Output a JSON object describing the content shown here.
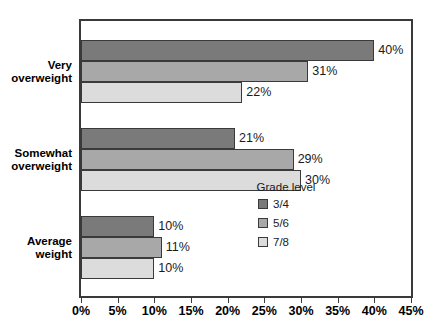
{
  "chart_data": {
    "type": "bar",
    "orientation": "horizontal",
    "title": "",
    "xlabel": "",
    "ylabel": "",
    "xlim": [
      0,
      45
    ],
    "xtick_labels": [
      "0%",
      "5%",
      "10%",
      "15%",
      "20%",
      "25%",
      "30%",
      "35%",
      "40%",
      "45%"
    ],
    "xticks": [
      0,
      5,
      10,
      15,
      20,
      25,
      30,
      35,
      40,
      45
    ],
    "grid": false,
    "legend_title": "Grade level",
    "legend_position": "inside-lower-right",
    "categories": [
      "Very overweight",
      "Somewhat overweight",
      "Average weight"
    ],
    "series": [
      {
        "name": "3/4",
        "color": "#7a7a7a",
        "values": [
          40,
          31,
          10
        ],
        "data_labels": [
          "40%",
          "21%",
          "10%"
        ]
      },
      {
        "name": "5/6",
        "color": "#a8a8a8",
        "values": [
          31,
          29,
          11
        ],
        "data_labels": [
          "31%",
          "29%",
          "11%"
        ]
      },
      {
        "name": "7/8",
        "color": "#dcdcdc",
        "values": [
          22,
          30,
          10
        ],
        "data_labels": [
          "22%",
          "30%",
          "10%"
        ]
      }
    ],
    "groups": [
      {
        "category": "Very overweight",
        "category_line1": "Very",
        "category_line2": "overweight",
        "bars": [
          {
            "series": "3/4",
            "value": 40,
            "label": "40%",
            "color": "#7a7a7a"
          },
          {
            "series": "5/6",
            "value": 31,
            "label": "31%",
            "color": "#a8a8a8"
          },
          {
            "series": "7/8",
            "value": 22,
            "label": "22%",
            "color": "#dcdcdc"
          }
        ]
      },
      {
        "category": "Somewhat overweight",
        "category_line1": "Somewhat",
        "category_line2": "overweight",
        "bars": [
          {
            "series": "3/4",
            "value": 21,
            "label": "21%",
            "color": "#7a7a7a"
          },
          {
            "series": "5/6",
            "value": 29,
            "label": "29%",
            "color": "#a8a8a8"
          },
          {
            "series": "7/8",
            "value": 30,
            "label": "30%",
            "color": "#dcdcdc"
          }
        ]
      },
      {
        "category": "Average weight",
        "category_line1": "Average",
        "category_line2": "weight",
        "bars": [
          {
            "series": "3/4",
            "value": 10,
            "label": "10%",
            "color": "#7a7a7a"
          },
          {
            "series": "5/6",
            "value": 11,
            "label": "11%",
            "color": "#a8a8a8"
          },
          {
            "series": "7/8",
            "value": 10,
            "label": "10%",
            "color": "#dcdcdc"
          }
        ]
      }
    ]
  },
  "colors": {
    "axis": "#3a3a3a",
    "text": "#000000",
    "background": "#ffffff",
    "series_3_4": "#7a7a7a",
    "series_5_6": "#a8a8a8",
    "series_7_8": "#dcdcdc"
  }
}
